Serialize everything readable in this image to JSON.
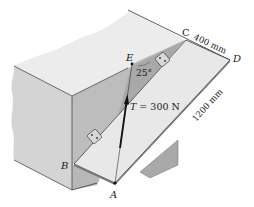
{
  "figure": {
    "type": "statics-3d-diagram"
  },
  "points": {
    "A": "A",
    "B": "B",
    "C": "C",
    "D": "D",
    "E": "E"
  },
  "labels": {
    "tension": "T = 300 N",
    "tension_symbol": "T",
    "tension_value": " = 300 N",
    "angle": "25°",
    "dim_cd": "400 mm",
    "dim_da": "1200 mm"
  },
  "colors": {
    "block_top": "#ececec",
    "block_front": "#d2d2d2",
    "block_side": "#bdbdbd",
    "plate": "#e6e6e6",
    "wedge_shadow": "#a9a9a9",
    "shadow_triangle": "#9c9c9c",
    "line": "#333333"
  }
}
